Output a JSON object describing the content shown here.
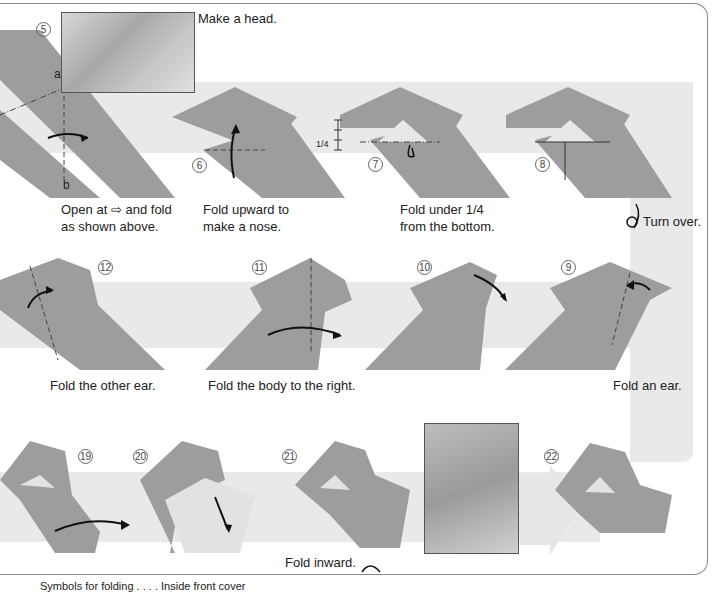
{
  "page": {
    "colors": {
      "paper": "#9d9d9d",
      "paper_light": "#e2e2e2",
      "band": "#e9e9e9",
      "frame": "#8a8a8a",
      "text": "#222222"
    },
    "steps": [
      {
        "number": "5",
        "label": "Make a head.",
        "caption": "Open at ⇨ and fold\nas shown above.",
        "points": [
          "a",
          "b"
        ]
      },
      {
        "number": "6",
        "caption": "Fold upward to\nmake a nose."
      },
      {
        "number": "7",
        "caption": "Fold under 1/4\nfrom the bottom.",
        "measure": "1/4"
      },
      {
        "number": "8",
        "caption": ""
      },
      {
        "number": "9",
        "caption": "Fold an ear."
      },
      {
        "number": "10",
        "caption": ""
      },
      {
        "number": "11",
        "caption": "Fold the body to the right."
      },
      {
        "number": "12",
        "caption": "Fold the other ear."
      },
      {
        "number": "19",
        "caption": ""
      },
      {
        "number": "20",
        "caption": ""
      },
      {
        "number": "21",
        "caption": "Fold inward."
      },
      {
        "number": "22",
        "caption": ""
      }
    ],
    "turn_over": "Turn over.",
    "footer_text": "Symbols for folding . . . . Inside front cover"
  }
}
